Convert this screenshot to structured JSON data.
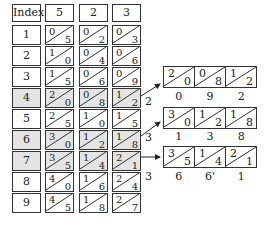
{
  "table": {
    "index_header": "Index",
    "columns": [
      {
        "header": "5",
        "cells": [
          [
            "0",
            "5"
          ],
          [
            "1",
            "0"
          ],
          [
            "1",
            "5"
          ],
          [
            "2",
            "0"
          ],
          [
            "2",
            "5"
          ],
          [
            "3",
            "0"
          ],
          [
            "3",
            "5"
          ],
          [
            "4",
            "0"
          ],
          [
            "4",
            "5"
          ]
        ]
      },
      {
        "header": "2",
        "cells": [
          [
            "0",
            "2"
          ],
          [
            "0",
            "4"
          ],
          [
            "0",
            "6"
          ],
          [
            "0",
            "8"
          ],
          [
            "1",
            "0"
          ],
          [
            "1",
            "2"
          ],
          [
            "1",
            "4"
          ],
          [
            "1",
            "6"
          ],
          [
            "1",
            "8"
          ]
        ]
      },
      {
        "header": "3",
        "cells": [
          [
            "0",
            "3"
          ],
          [
            "0",
            "6"
          ],
          [
            "0",
            "9"
          ],
          [
            "1",
            "2"
          ],
          [
            "1",
            "5"
          ],
          [
            "1",
            "8"
          ],
          [
            "2",
            "1"
          ],
          [
            "2",
            "4"
          ],
          [
            "2",
            "7"
          ]
        ]
      }
    ],
    "indices": [
      "1",
      "2",
      "3",
      "4",
      "5",
      "6",
      "7",
      "8",
      "9"
    ],
    "highlighted_rows": [
      "4",
      "6",
      "7"
    ],
    "highlight_color": "#e4e4e4"
  },
  "products": [
    {
      "multiplier_label": "2",
      "cells": [
        [
          "2",
          "0"
        ],
        [
          "0",
          "8"
        ],
        [
          "1",
          "2"
        ]
      ],
      "result_digits": [
        "0",
        "9",
        "2"
      ]
    },
    {
      "multiplier_label": "3",
      "cells": [
        [
          "3",
          "0"
        ],
        [
          "1",
          "2"
        ],
        [
          "1",
          "8"
        ]
      ],
      "result_digits": [
        "1",
        "3",
        "8"
      ]
    },
    {
      "multiplier_label": "3",
      "cells": [
        [
          "3",
          "5"
        ],
        [
          "1",
          "4"
        ],
        [
          "2",
          "1"
        ]
      ],
      "result_digits": [
        "6",
        "6'",
        "1"
      ]
    }
  ]
}
